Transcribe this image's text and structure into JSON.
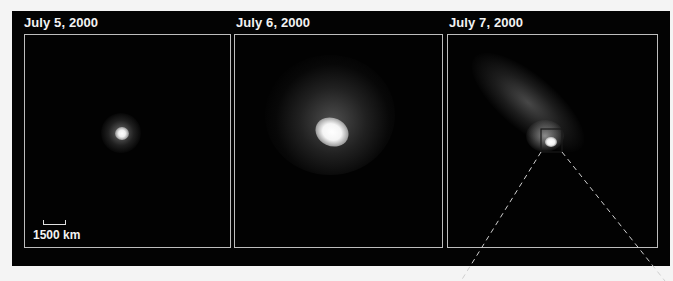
{
  "figure": {
    "panels": [
      {
        "caption": "July 5, 2000",
        "description": "comet nucleus small compact coma"
      },
      {
        "caption": "July 6, 2000",
        "description": "comet with bright nucleus and diffuse coma"
      },
      {
        "caption": "July 7, 2000",
        "description": "elongated disrupted comet with zoom box on nucleus"
      }
    ],
    "scale_bar": {
      "label": "1500 km"
    },
    "colors": {
      "background": "#030303",
      "panel_border": "#bdbdbd",
      "text": "#f2f2f2",
      "page": "#f4f4f4"
    }
  }
}
